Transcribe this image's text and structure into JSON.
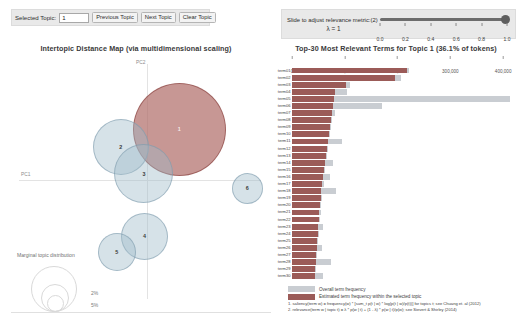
{
  "topic_bar": {
    "label": "Selected Topic:",
    "value": "1",
    "prev_label": "Previous Topic",
    "next_label": "Next Topic",
    "clear_label": "Clear Topic"
  },
  "lambda_bar": {
    "instruction": "Slide to adjust relevance metric:(2)",
    "lambda_label": "λ = 1",
    "value": 1.0,
    "ticks": [
      "0.0",
      "0.2",
      "0.4",
      "0.6",
      "0.8",
      "1.0"
    ]
  },
  "mds": {
    "title": "Intertopic Distance Map (via multidimensional scaling)",
    "x_axis_label": "PC1",
    "y_axis_label": "PC2",
    "legend_title": "Marginal topic distribution",
    "legend_values": [
      "2%",
      "5%",
      "10%"
    ],
    "selected_topic": 1,
    "topics": [
      {
        "id": "1",
        "x": 0.92,
        "y": 1.52,
        "r": 45.5,
        "selected": true
      },
      {
        "id": "2",
        "x": -0.8,
        "y": 1.0,
        "r": 27.0,
        "selected": false
      },
      {
        "id": "3",
        "x": -0.12,
        "y": 0.22,
        "r": 28.5,
        "selected": false
      },
      {
        "id": "4",
        "x": -0.1,
        "y": -1.62,
        "r": 22.5,
        "selected": false
      },
      {
        "id": "5",
        "x": -0.92,
        "y": -2.08,
        "r": 18.0,
        "selected": false
      },
      {
        "id": "6",
        "x": 2.92,
        "y": -0.22,
        "r": 14.5,
        "selected": false
      }
    ]
  },
  "chart_data": {
    "type": "bar",
    "title": "Top-30 Most Relevant Terms for Topic 1 (36.1% of tokens)",
    "orientation": "horizontal",
    "xlabel": "",
    "ylabel": "",
    "xlim": [
      0,
      430000
    ],
    "xticks": [
      0,
      100000,
      200000,
      300000,
      400000
    ],
    "xtick_labels": [
      "0",
      "100,000",
      "200,000",
      "300,000",
      "400,000"
    ],
    "grid": false,
    "legend_position": "bottom-left",
    "series": [
      {
        "name": "Overall term frequency",
        "color": "#c9cdd2"
      },
      {
        "name": "Estimated term frequency within the selected topic",
        "color": "#9b5b58"
      }
    ],
    "categories": [
      "term01",
      "term02",
      "term03",
      "term04",
      "term05",
      "term06",
      "term07",
      "term08",
      "term09",
      "term10",
      "term11",
      "term12",
      "term13",
      "term14",
      "term15",
      "term16",
      "term17",
      "term18",
      "term19",
      "term20",
      "term21",
      "term22",
      "term23",
      "term24",
      "term25",
      "term26",
      "term27",
      "term28",
      "term29",
      "term30"
    ],
    "topic_values": [
      218000,
      195000,
      103000,
      82000,
      80000,
      78000,
      76000,
      74000,
      72000,
      70000,
      68000,
      66000,
      64000,
      62000,
      60000,
      58000,
      56000,
      55000,
      54000,
      53000,
      52000,
      51000,
      50000,
      49000,
      48000,
      47000,
      46000,
      45000,
      44000,
      43000
    ],
    "overall_values": [
      221000,
      207000,
      110000,
      105000,
      413000,
      171000,
      81000,
      76000,
      74000,
      72000,
      95000,
      68000,
      66000,
      78000,
      63000,
      72000,
      60000,
      83000,
      56000,
      55000,
      54000,
      53000,
      58000,
      51000,
      50000,
      56000,
      48000,
      74000,
      46000,
      58000
    ]
  },
  "bottom_legend": {
    "overall_label": "Overall term frequency",
    "topic_label": "Estimated term frequency within the selected topic",
    "footnote1": "1. saliency(term w) = frequency(w) * [sum_t p(t | w) * log(p(t | w)/p(t))] for topics t; see Chuang et. al (2012)",
    "footnote2": "2. relevance(term w | topic t) = λ * p(w | t) + (1 - λ) * p(w | t)/p(w); see Sievert & Shirley (2014)"
  }
}
